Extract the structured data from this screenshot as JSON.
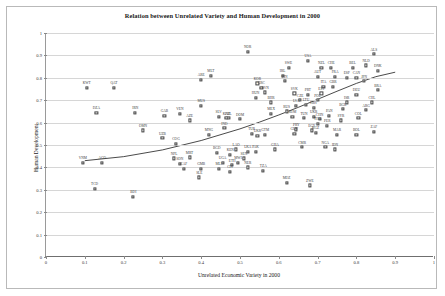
{
  "chart_data": {
    "type": "scatter",
    "title": "Relation between Unrelated Variety and Human Development in 2000",
    "xlabel": "Unrelated Economic Variety in 2000",
    "ylabel": "Human Development",
    "xlim": [
      0,
      1
    ],
    "ylim": [
      0,
      1
    ],
    "xticks": [
      "0",
      "0.1",
      "0.2",
      "0.3",
      "0.4",
      "0.5",
      "0.6",
      "0.7",
      "0.8",
      "0.9",
      "1"
    ],
    "yticks": [
      "0",
      "0.1",
      "0.2",
      "0.3",
      "0.4",
      "0.5",
      "0.6",
      "0.7",
      "0.8",
      "0.9",
      "1"
    ],
    "grid": "horizontal",
    "legend": "none",
    "marker": "open-square",
    "point_label_field": "iso3",
    "trendline": {
      "type": "fitted-curve",
      "points": [
        [
          0.1,
          0.43
        ],
        [
          0.2,
          0.448
        ],
        [
          0.3,
          0.478
        ],
        [
          0.4,
          0.52
        ],
        [
          0.5,
          0.572
        ],
        [
          0.55,
          0.602
        ],
        [
          0.6,
          0.634
        ],
        [
          0.65,
          0.668
        ],
        [
          0.7,
          0.704
        ],
        [
          0.75,
          0.74
        ],
        [
          0.8,
          0.775
        ],
        [
          0.85,
          0.805
        ],
        [
          0.9,
          0.825
        ]
      ]
    },
    "points": [
      {
        "iso3": "KWT",
        "x": 0.105,
        "y": 0.755
      },
      {
        "iso3": "QAT",
        "x": 0.175,
        "y": 0.755
      },
      {
        "iso3": "DZA",
        "x": 0.13,
        "y": 0.645
      },
      {
        "iso3": "IRN",
        "x": 0.23,
        "y": 0.645
      },
      {
        "iso3": "GAB",
        "x": 0.305,
        "y": 0.63
      },
      {
        "iso3": "VEN",
        "x": 0.345,
        "y": 0.64
      },
      {
        "iso3": "OMN",
        "x": 0.25,
        "y": 0.565
      },
      {
        "iso3": "UZB",
        "x": 0.3,
        "y": 0.53
      },
      {
        "iso3": "COG",
        "x": 0.335,
        "y": 0.505
      },
      {
        "iso3": "VNM",
        "x": 0.095,
        "y": 0.42
      },
      {
        "iso3": "AGO",
        "x": 0.145,
        "y": 0.42
      },
      {
        "iso3": "TCD",
        "x": 0.125,
        "y": 0.305
      },
      {
        "iso3": "BDI",
        "x": 0.225,
        "y": 0.27
      },
      {
        "iso3": "ARE",
        "x": 0.4,
        "y": 0.79
      },
      {
        "iso3": "MLT",
        "x": 0.425,
        "y": 0.81
      },
      {
        "iso3": "MUS",
        "x": 0.4,
        "y": 0.675
      },
      {
        "iso3": "AZE",
        "x": 0.37,
        "y": 0.61
      },
      {
        "iso3": "SLV",
        "x": 0.445,
        "y": 0.625
      },
      {
        "iso3": "PHL",
        "x": 0.47,
        "y": 0.62
      },
      {
        "iso3": "IND",
        "x": 0.46,
        "y": 0.575
      },
      {
        "iso3": "MNG",
        "x": 0.42,
        "y": 0.545
      },
      {
        "iso3": "NOR",
        "x": 0.52,
        "y": 0.915
      },
      {
        "iso3": "KOR",
        "x": 0.545,
        "y": 0.775
      },
      {
        "iso3": "HUN",
        "x": 0.54,
        "y": 0.71
      },
      {
        "iso3": "GRC",
        "x": 0.555,
        "y": 0.755
      },
      {
        "iso3": "SVN",
        "x": 0.565,
        "y": 0.735
      },
      {
        "iso3": "BHR",
        "x": 0.58,
        "y": 0.69
      },
      {
        "iso3": "SWE",
        "x": 0.625,
        "y": 0.845
      },
      {
        "iso3": "IRL",
        "x": 0.61,
        "y": 0.81
      },
      {
        "iso3": "FIN",
        "x": 0.615,
        "y": 0.785
      },
      {
        "iso3": "USA",
        "x": 0.675,
        "y": 0.875
      },
      {
        "iso3": "NZL",
        "x": 0.71,
        "y": 0.845
      },
      {
        "iso3": "CHE",
        "x": 0.735,
        "y": 0.845
      },
      {
        "iso3": "BEL",
        "x": 0.79,
        "y": 0.845
      },
      {
        "iso3": "AUT",
        "x": 0.7,
        "y": 0.805
      },
      {
        "iso3": "FRA",
        "x": 0.745,
        "y": 0.805
      },
      {
        "iso3": "ESP",
        "x": 0.775,
        "y": 0.8
      },
      {
        "iso3": "CAN",
        "x": 0.8,
        "y": 0.8
      },
      {
        "iso3": "ITA",
        "x": 0.715,
        "y": 0.76
      },
      {
        "iso3": "GBR",
        "x": 0.74,
        "y": 0.76
      },
      {
        "iso3": "SVK",
        "x": 0.64,
        "y": 0.73
      },
      {
        "iso3": "PRT",
        "x": 0.675,
        "y": 0.725
      },
      {
        "iso3": "EST",
        "x": 0.71,
        "y": 0.73
      },
      {
        "iso3": "CZE",
        "x": 0.655,
        "y": 0.7
      },
      {
        "iso3": "POL",
        "x": 0.7,
        "y": 0.7
      },
      {
        "iso3": "LVA",
        "x": 0.645,
        "y": 0.675
      },
      {
        "iso3": "LTU",
        "x": 0.67,
        "y": 0.68
      },
      {
        "iso3": "HRV",
        "x": 0.69,
        "y": 0.665
      },
      {
        "iso3": "ALS",
        "x": 0.845,
        "y": 0.905
      },
      {
        "iso3": "NLD",
        "x": 0.825,
        "y": 0.855
      },
      {
        "iso3": "DNK",
        "x": 0.855,
        "y": 0.83
      },
      {
        "iso3": "BRA",
        "x": 0.855,
        "y": 0.745
      },
      {
        "iso3": "RUS",
        "x": 0.62,
        "y": 0.65
      },
      {
        "iso3": "MEX",
        "x": 0.58,
        "y": 0.64
      },
      {
        "iso3": "ROM",
        "x": 0.635,
        "y": 0.625
      },
      {
        "iso3": "TUN",
        "x": 0.665,
        "y": 0.62
      },
      {
        "iso3": "UKR",
        "x": 0.69,
        "y": 0.625
      },
      {
        "iso3": "PAN",
        "x": 0.73,
        "y": 0.63
      },
      {
        "iso3": "CHN",
        "x": 0.705,
        "y": 0.615
      },
      {
        "iso3": "THA",
        "x": 0.7,
        "y": 0.595
      },
      {
        "iso3": "PER",
        "x": 0.725,
        "y": 0.585
      },
      {
        "iso3": "PRY",
        "x": 0.645,
        "y": 0.57
      },
      {
        "iso3": "EGY",
        "x": 0.685,
        "y": 0.565
      },
      {
        "iso3": "KGZ",
        "x": 0.695,
        "y": 0.555
      },
      {
        "iso3": "GUY",
        "x": 0.64,
        "y": 0.55
      },
      {
        "iso3": "KAZ",
        "x": 0.465,
        "y": 0.62
      },
      {
        "iso3": "DOM",
        "x": 0.5,
        "y": 0.615
      },
      {
        "iso3": "TUR",
        "x": 0.53,
        "y": 0.55
      },
      {
        "iso3": "UKR2",
        "x": 0.545,
        "y": 0.54
      },
      {
        "iso3": "GTM",
        "x": 0.565,
        "y": 0.545
      },
      {
        "iso3": "LAO",
        "x": 0.49,
        "y": 0.48
      },
      {
        "iso3": "LKA",
        "x": 0.52,
        "y": 0.47
      },
      {
        "iso3": "PAK",
        "x": 0.54,
        "y": 0.47
      },
      {
        "iso3": "GHA",
        "x": 0.59,
        "y": 0.48
      },
      {
        "iso3": "KEN",
        "x": 0.475,
        "y": 0.455
      },
      {
        "iso3": "BGD",
        "x": 0.44,
        "y": 0.465
      },
      {
        "iso3": "NPL",
        "x": 0.33,
        "y": 0.44
      },
      {
        "iso3": "MRT",
        "x": 0.37,
        "y": 0.445
      },
      {
        "iso3": "SDN",
        "x": 0.345,
        "y": 0.415
      },
      {
        "iso3": "CAF",
        "x": 0.355,
        "y": 0.395
      },
      {
        "iso3": "GMB",
        "x": 0.4,
        "y": 0.395
      },
      {
        "iso3": "MLI",
        "x": 0.445,
        "y": 0.395
      },
      {
        "iso3": "ETH",
        "x": 0.48,
        "y": 0.41
      },
      {
        "iso3": "UGA",
        "x": 0.455,
        "y": 0.42
      },
      {
        "iso3": "MWI",
        "x": 0.495,
        "y": 0.42
      },
      {
        "iso3": "SEN",
        "x": 0.51,
        "y": 0.44
      },
      {
        "iso3": "NER",
        "x": 0.52,
        "y": 0.4
      },
      {
        "iso3": "TZA",
        "x": 0.56,
        "y": 0.385
      },
      {
        "iso3": "SLE",
        "x": 0.395,
        "y": 0.355
      },
      {
        "iso3": "MOZ",
        "x": 0.62,
        "y": 0.33
      },
      {
        "iso3": "ZWE",
        "x": 0.68,
        "y": 0.32
      },
      {
        "iso3": "MAR",
        "x": 0.75,
        "y": 0.545
      },
      {
        "iso3": "IDN",
        "x": 0.745,
        "y": 0.48
      },
      {
        "iso3": "BOL",
        "x": 0.8,
        "y": 0.545
      },
      {
        "iso3": "ZAF",
        "x": 0.845,
        "y": 0.56
      },
      {
        "iso3": "COL",
        "x": 0.805,
        "y": 0.62
      },
      {
        "iso3": "ARG",
        "x": 0.825,
        "y": 0.655
      },
      {
        "iso3": "CHL",
        "x": 0.84,
        "y": 0.69
      },
      {
        "iso3": "JPN",
        "x": 0.82,
        "y": 0.785
      },
      {
        "iso3": "DEU",
        "x": 0.8,
        "y": 0.725
      },
      {
        "iso3": "ISR",
        "x": 0.775,
        "y": 0.69
      },
      {
        "iso3": "BGR",
        "x": 0.765,
        "y": 0.66
      },
      {
        "iso3": "NGA",
        "x": 0.72,
        "y": 0.49
      },
      {
        "iso3": "CMR",
        "x": 0.66,
        "y": 0.49
      },
      {
        "iso3": "CIV",
        "x": 0.475,
        "y": 0.38
      },
      {
        "iso3": "SYR",
        "x": 0.76,
        "y": 0.61
      }
    ]
  }
}
